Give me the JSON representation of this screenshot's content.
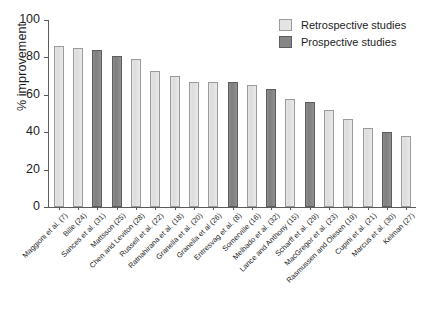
{
  "chart_data": {
    "type": "bar",
    "title": "",
    "xlabel": "",
    "ylabel": "% improvement",
    "ylim": [
      0,
      100
    ],
    "yticks": [
      0,
      20,
      40,
      60,
      80,
      100
    ],
    "grid": false,
    "legend_position": "top-right",
    "legend": [
      {
        "key": "retrospective",
        "label": "Retrospective studies",
        "color": "#e4e4e4"
      },
      {
        "key": "prospective",
        "label": "Prospective studies",
        "color": "#868686"
      }
    ],
    "categories": [
      "Maggioni et al. (7)",
      "Bille (24)",
      "Sances et al. (31)",
      "Mattsson (25)",
      "Chen and Leviton (28)",
      "Russell et al. (22)",
      "Ratnahirana et al. (18)",
      "Granella et al. (20)",
      "Granella et al (26)",
      "Entresvag et al. (8)",
      "Somerville (16)",
      "Melhado et al. (32)",
      "Lance and Anthony (15)",
      "Scharff et al. (29)",
      "MacGregor et al. (23)",
      "Rasmussen and Olesen (19)",
      "Cupini et al. (21)",
      "Marcus et al. (30)",
      "Kelman (27)"
    ],
    "values": [
      86,
      85,
      84,
      81,
      79,
      73,
      70,
      67,
      67,
      67,
      65,
      63,
      58,
      56,
      52,
      47,
      42,
      40,
      38
    ],
    "group": [
      "retrospective",
      "retrospective",
      "prospective",
      "prospective",
      "retrospective",
      "retrospective",
      "retrospective",
      "retrospective",
      "retrospective",
      "prospective",
      "retrospective",
      "prospective",
      "retrospective",
      "prospective",
      "retrospective",
      "retrospective",
      "retrospective",
      "prospective",
      "retrospective"
    ]
  }
}
